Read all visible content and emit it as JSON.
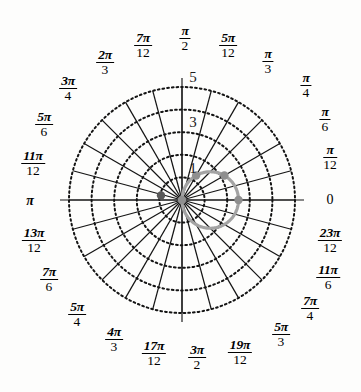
{
  "figure": {
    "kind": "polar-grid-plot",
    "background_color": "#fdfdfc",
    "grid_color": "#141414",
    "curve_color": "#a3a3a3",
    "point_color": "#8f8f8f",
    "dark_point_color": "#595959"
  },
  "chart_data": {
    "type": "line",
    "title": "",
    "subtitle": "",
    "xlabel": "",
    "ylabel": "",
    "projection": "polar",
    "grid": true,
    "legend": null,
    "center_px": [
      182,
      200
    ],
    "outer_radius_px": 113,
    "radial": {
      "label": "r",
      "rlim": [
        0,
        5
      ],
      "ticks": [
        1,
        2,
        3,
        4,
        5
      ],
      "tick_labels_shown": [
        "1",
        "3",
        "5"
      ],
      "tick_label_angle_deg": 90,
      "circle_style": "dotted"
    },
    "angular": {
      "label": "theta",
      "divisions": 24,
      "step": "pi/12",
      "spoke_style": "solid",
      "tick_labels": [
        "0",
        "π/12",
        "π/6",
        "π/4",
        "π/3",
        "5π/12",
        "π/2",
        "7π/12",
        "2π/3",
        "3π/4",
        "5π/6",
        "11π/12",
        "π",
        "13π/12",
        "7π/6",
        "5π/4",
        "4π/3",
        "17π/12",
        "3π/2",
        "19π/12",
        "5π/3",
        "7π/4",
        "11π/6",
        "23π/12"
      ]
    },
    "series": [
      {
        "name": "circle-through-origin",
        "equation": "r = 2.5 cos(theta)",
        "color": "#a3a3a3",
        "linewidth": 3.2,
        "theta_range_rad": [
          -1.5707963,
          1.5707963
        ],
        "points_theta_deg": [
          -90,
          -75,
          -60,
          -45,
          -30,
          -15,
          0,
          15,
          30,
          45,
          60,
          75,
          90
        ],
        "points_r": [
          0.0,
          0.647,
          1.25,
          1.768,
          2.165,
          2.415,
          2.5,
          2.415,
          2.165,
          1.768,
          1.25,
          0.647,
          0.0
        ]
      }
    ],
    "marked_points": [
      {
        "name": "point-theta-0",
        "theta_deg": 0,
        "r": 2.5,
        "color": "#8f8f8f"
      },
      {
        "name": "point-theta-30",
        "theta_deg": 30,
        "r": 2.165,
        "color": "#8f8f8f"
      },
      {
        "name": "point-theta-60",
        "theta_deg": 60,
        "r": 1.25,
        "color": "#8f8f8f"
      },
      {
        "name": "point-origin",
        "theta_deg": 90,
        "r": 0.0,
        "color": "#8f8f8f"
      },
      {
        "name": "point-theta-170",
        "theta_deg": 168,
        "r": 0.95,
        "color": "#595959"
      }
    ]
  },
  "angular_labels": [
    {
      "id": "theta-0",
      "kind": "whole",
      "text": "0",
      "num": "",
      "den": "",
      "x": 330,
      "y": 200
    },
    {
      "id": "theta-pi-12",
      "kind": "frac",
      "text": "π/12",
      "num": "π",
      "den": "12",
      "x": 330,
      "y": 157
    },
    {
      "id": "theta-pi-6",
      "kind": "frac",
      "text": "π/6",
      "num": "π",
      "den": "6",
      "x": 325,
      "y": 119
    },
    {
      "id": "theta-pi-4",
      "kind": "frac",
      "text": "π/4",
      "num": "π",
      "den": "4",
      "x": 306,
      "y": 85
    },
    {
      "id": "theta-pi-3",
      "kind": "frac",
      "text": "π/3",
      "num": "π",
      "den": "3",
      "x": 268,
      "y": 61
    },
    {
      "id": "theta-5pi-12",
      "kind": "frac",
      "text": "5π/12",
      "num": "5π",
      "den": "12",
      "x": 228,
      "y": 45
    },
    {
      "id": "theta-pi-2",
      "kind": "frac",
      "text": "π/2",
      "num": "π",
      "den": "2",
      "x": 185,
      "y": 38
    },
    {
      "id": "theta-7pi-12",
      "kind": "frac",
      "text": "7π/12",
      "num": "7π",
      "den": "12",
      "x": 143,
      "y": 45
    },
    {
      "id": "theta-2pi-3",
      "kind": "frac",
      "text": "2π/3",
      "num": "2π",
      "den": "3",
      "x": 105,
      "y": 62
    },
    {
      "id": "theta-3pi-4",
      "kind": "frac",
      "text": "3π/4",
      "num": "3π",
      "den": "4",
      "x": 68,
      "y": 88
    },
    {
      "id": "theta-5pi-6",
      "kind": "frac",
      "text": "5π/6",
      "num": "5π",
      "den": "6",
      "x": 44,
      "y": 124
    },
    {
      "id": "theta-11pi-12",
      "kind": "frac",
      "text": "11π/12",
      "num": "11π",
      "den": "12",
      "x": 33,
      "y": 163
    },
    {
      "id": "theta-pi",
      "kind": "whole",
      "text": "π",
      "num": "",
      "den": "",
      "x": 30,
      "y": 201
    },
    {
      "id": "theta-13pi-12",
      "kind": "frac",
      "text": "13π/12",
      "num": "13π",
      "den": "12",
      "x": 34,
      "y": 240
    },
    {
      "id": "theta-7pi-6",
      "kind": "frac",
      "text": "7π/6",
      "num": "7π",
      "den": "6",
      "x": 49,
      "y": 279
    },
    {
      "id": "theta-5pi-4",
      "kind": "frac",
      "text": "5π/4",
      "num": "5π",
      "den": "4",
      "x": 77,
      "y": 314
    },
    {
      "id": "theta-4pi-3",
      "kind": "frac",
      "text": "4π/3",
      "num": "4π",
      "den": "3",
      "x": 114,
      "y": 339
    },
    {
      "id": "theta-17pi-12",
      "kind": "frac",
      "text": "17π/12",
      "num": "17π",
      "den": "12",
      "x": 154,
      "y": 353
    },
    {
      "id": "theta-3pi-2",
      "kind": "frac",
      "text": "3π/2",
      "num": "3π",
      "den": "2",
      "x": 197,
      "y": 357
    },
    {
      "id": "theta-19pi-12",
      "kind": "frac",
      "text": "19π/12",
      "num": "19π",
      "den": "12",
      "x": 240,
      "y": 352
    },
    {
      "id": "theta-5pi-3",
      "kind": "frac",
      "text": "5π/3",
      "num": "5π",
      "den": "3",
      "x": 281,
      "y": 334
    },
    {
      "id": "theta-7pi-4",
      "kind": "frac",
      "text": "7π/4",
      "num": "7π",
      "den": "4",
      "x": 310,
      "y": 308
    },
    {
      "id": "theta-11pi-6",
      "kind": "frac",
      "text": "11π/6",
      "num": "11π",
      "den": "6",
      "x": 328,
      "y": 277
    },
    {
      "id": "theta-23pi-12",
      "kind": "frac",
      "text": "23π/12",
      "num": "23π",
      "den": "12",
      "x": 330,
      "y": 240
    }
  ],
  "radial_labels": [
    {
      "id": "r-5",
      "text": "5",
      "x": 193,
      "y": 77
    },
    {
      "id": "r-3",
      "text": "3",
      "x": 193,
      "y": 122
    },
    {
      "id": "r-1",
      "text": "1",
      "x": 193,
      "y": 168
    }
  ]
}
